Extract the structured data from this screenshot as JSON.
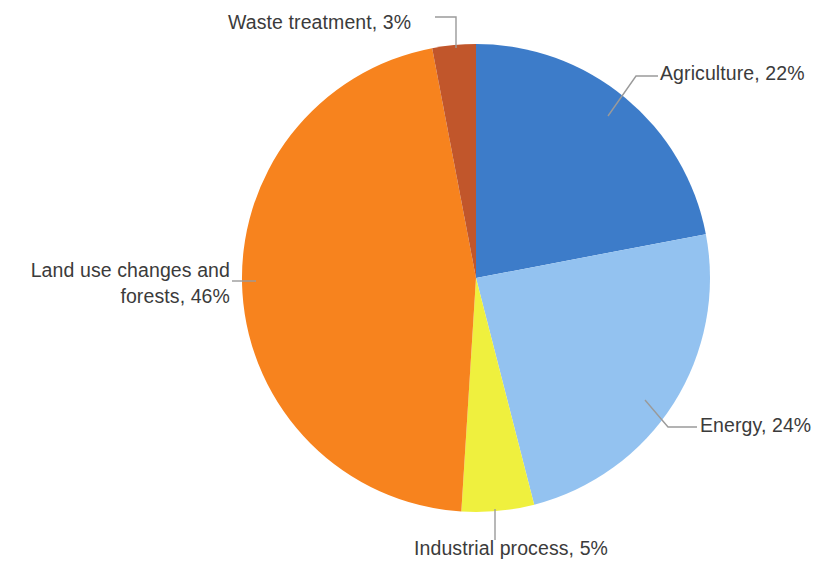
{
  "chart_data": {
    "type": "pie",
    "title": "",
    "subtitle": "",
    "xlabel": "",
    "ylabel": "",
    "legend_position": "none",
    "grid": false,
    "unit": "%",
    "total": 100,
    "categories": [
      "Agriculture",
      "Energy",
      "Industrial process",
      "Land use changes and forests",
      "Waste treatment"
    ],
    "values": [
      22,
      24,
      5,
      46,
      3
    ],
    "colors": [
      "#3D7CC9",
      "#93C2F0",
      "#EFF03E",
      "#F7831E",
      "#C1562B"
    ],
    "start_angle_deg": 0,
    "direction": "clockwise",
    "slices": [
      {
        "id": "agriculture",
        "name": "Agriculture",
        "value": 22,
        "label": "Agriculture, 22%",
        "color": "#3D7CC9",
        "label_position": "right-top"
      },
      {
        "id": "energy",
        "name": "Energy",
        "value": 24,
        "label": "Energy, 24%",
        "color": "#93C2F0",
        "label_position": "right-bottom"
      },
      {
        "id": "industrial-process",
        "name": "Industrial process",
        "value": 5,
        "label": "Industrial process, 5%",
        "color": "#EFF03E",
        "label_position": "bottom"
      },
      {
        "id": "land-use-changes-and-forests",
        "name": "Land use changes and forests",
        "value": 46,
        "label_line1": "Land use changes and",
        "label_line2": "forests, 46%",
        "label": "Land use changes and forests, 46%",
        "color": "#F7831E",
        "label_position": "left"
      },
      {
        "id": "waste-treatment",
        "name": "Waste treatment",
        "value": 3,
        "label": "Waste treatment, 3%",
        "color": "#C1562B",
        "label_position": "top-left"
      }
    ],
    "geometry": {
      "center_x": 476,
      "center_y": 278,
      "radius": 234
    },
    "leader_line_color": "#9A9A9A",
    "label_text_color": "#3B3B3B"
  }
}
